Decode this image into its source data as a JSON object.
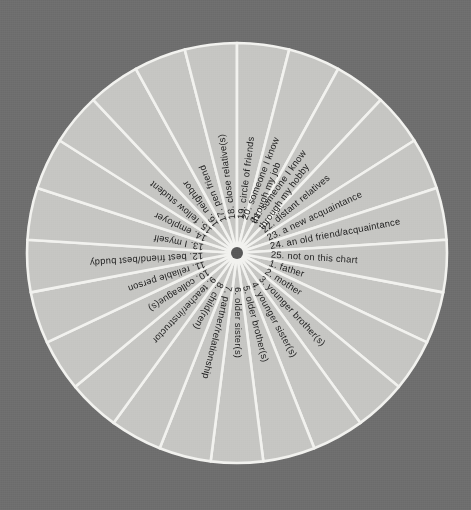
{
  "page": {
    "background_color": "#6e6e6e",
    "sector_fill_color": "#c6c6c3",
    "divider_color": "#f2f2ef",
    "hub_color": "#585858",
    "label_color": "#1d1d1d"
  },
  "chart_data": {
    "type": "pie",
    "title": "",
    "subtitle": "",
    "xlabel": "",
    "ylabel": "",
    "legend_position": "none",
    "grid": false,
    "equal_slices": true,
    "slice_count": 25,
    "slice_angle_degrees": 14.4,
    "start_angle_degrees": 0,
    "direction": "clockwise",
    "center": {
      "x": 237,
      "y": 253
    },
    "radius": 210,
    "hub_radius": 6,
    "categories": [
      "1. father",
      "2. mother",
      "3. younger brother(s)",
      "4. younger sister(s)",
      "5. older brother(s)",
      "6. older sister(s)",
      "7. partner/relationship",
      "8. child(ren)",
      "9. teacher/instructor",
      "10. colleague(s)",
      "11. reliable person",
      "12. best friend/best buddy",
      "13. I myself",
      "14. employer",
      "15. fellow student",
      "16. neighbor",
      "17. pen friend",
      "18. close relative(s)",
      "19. circle of friends",
      "20. someone I know through my job",
      "21. someone I know through my hobby",
      "22. distant relatives",
      "23. a new acquaintance",
      "24. an old friend/acquaintance",
      "25. not on this chart"
    ],
    "values": [
      4,
      4,
      4,
      4,
      4,
      4,
      4,
      4,
      4,
      4,
      4,
      4,
      4,
      4,
      4,
      4,
      4,
      4,
      4,
      4,
      4,
      4,
      4,
      4,
      4
    ]
  },
  "segments": [
    {
      "number": "1.",
      "label": "father",
      "full": "1.  father",
      "lines": [
        "1.  father"
      ]
    },
    {
      "number": "2.",
      "label": "mother",
      "full": "2.  mother",
      "lines": [
        "2.  mother"
      ]
    },
    {
      "number": "3.",
      "label": "younger brother(s)",
      "full": "3.  younger brother(s)",
      "lines": [
        "3.  younger brother(s)"
      ]
    },
    {
      "number": "4.",
      "label": "younger sister(s)",
      "full": "4.  younger sister(s)",
      "lines": [
        "4.  younger sister(s)"
      ]
    },
    {
      "number": "5.",
      "label": "older brother(s)",
      "full": "5.  older brother(s)",
      "lines": [
        "5.  older brother(s)"
      ]
    },
    {
      "number": "6.",
      "label": "older sister(s)",
      "full": "6.  older sister(s)",
      "lines": [
        "6.  older sister(s)"
      ]
    },
    {
      "number": "7.",
      "label": "partner/relationship",
      "full": "7.  partner/relationship",
      "lines": [
        "7.  partner/relationship"
      ]
    },
    {
      "number": "8.",
      "label": "child(ren)",
      "full": "8.  child(ren)",
      "lines": [
        "8.  child(ren)"
      ]
    },
    {
      "number": "9.",
      "label": "teacher/instructor",
      "full": "9.  teacher/instructor",
      "lines": [
        "9.  teacher/instructor"
      ]
    },
    {
      "number": "10.",
      "label": "colleague(s)",
      "full": "10.  colleague(s)",
      "lines": [
        "10.  colleague(s)"
      ]
    },
    {
      "number": "11.",
      "label": "reliable person",
      "full": "11.  reliable person",
      "lines": [
        "11.  reliable person"
      ]
    },
    {
      "number": "12.",
      "label": "best friend/best buddy",
      "full": "12.  best friend/best buddy",
      "lines": [
        "12.  best friend/best buddy"
      ]
    },
    {
      "number": "13.",
      "label": "I myself",
      "full": "13.  I myself",
      "lines": [
        "13.  I myself"
      ]
    },
    {
      "number": "14.",
      "label": "employer",
      "full": "14.  employer",
      "lines": [
        "14.  employer"
      ]
    },
    {
      "number": "15.",
      "label": "fellow student",
      "full": "15.  fellow student",
      "lines": [
        "15.  fellow student"
      ]
    },
    {
      "number": "16.",
      "label": "neighbor",
      "full": "16.  neighbor",
      "lines": [
        "16.  neighbor"
      ]
    },
    {
      "number": "17.",
      "label": "pen friend",
      "full": "17.  pen friend",
      "lines": [
        "17.  pen friend"
      ]
    },
    {
      "number": "18.",
      "label": "close relative(s)",
      "full": "18.  close relative(s)",
      "lines": [
        "18.  close relative(s)"
      ]
    },
    {
      "number": "19.",
      "label": "circle of friends",
      "full": "19.  circle of friends",
      "lines": [
        "19.  circle of friends"
      ]
    },
    {
      "number": "20.",
      "label": "someone I know through my job",
      "full": "20.  someone I know through my job",
      "lines": [
        "20.  someone I know",
        "through my job"
      ]
    },
    {
      "number": "21.",
      "label": "someone I know through my hobby",
      "full": "21.  someone I know through my hobby",
      "lines": [
        "21.  someone I know",
        "through my hobby"
      ]
    },
    {
      "number": "22.",
      "label": "distant relatives",
      "full": "22.  distant relatives",
      "lines": [
        "22.  distant relatives"
      ]
    },
    {
      "number": "23.",
      "label": "a new acquaintance",
      "full": "23.  a new acquaintance",
      "lines": [
        "23.  a new acquaintance"
      ]
    },
    {
      "number": "24.",
      "label": "an old friend/acquaintance",
      "full": "24.  an old friend/acquaintance",
      "lines": [
        "24.  an old friend/acquaintance"
      ]
    },
    {
      "number": "25.",
      "label": "not on this chart",
      "full": "25.  not on this chart",
      "lines": [
        "25.  not on this chart"
      ]
    }
  ]
}
